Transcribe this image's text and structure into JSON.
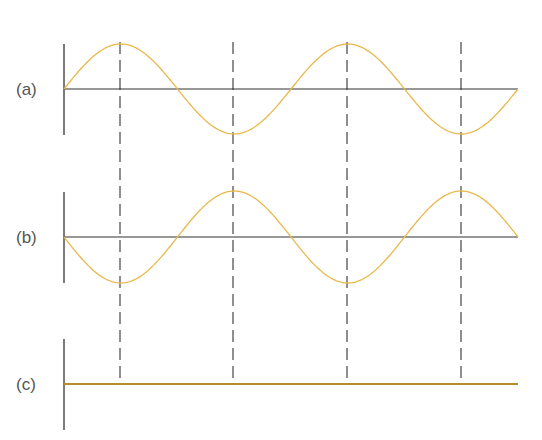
{
  "diagram": {
    "panels": [
      {
        "label": "(a)",
        "baseline_y": 89,
        "amplitude": 45,
        "phase": "sine",
        "color": "#e8b84a"
      },
      {
        "label": "(b)",
        "baseline_y": 237,
        "amplitude": -46,
        "phase": "negative-sine",
        "color": "#e8b84a"
      },
      {
        "label": "(c)",
        "baseline_y": 384,
        "amplitude": 0,
        "phase": "flat (sum)",
        "color": "#c9a030"
      }
    ],
    "x_start": 64,
    "x_end": 518,
    "wavelength_px": 227,
    "dashed_guides_x": [
      120,
      233,
      347,
      461
    ],
    "colors": {
      "axis": "#333333",
      "wave": "#e8b84a",
      "sum_line": "#b58e2a",
      "guides": "#444444"
    }
  }
}
